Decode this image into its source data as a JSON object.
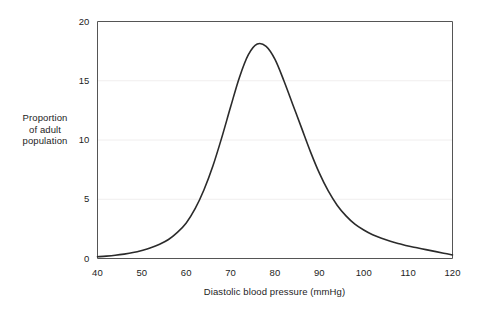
{
  "chart_data": {
    "type": "line",
    "title": "",
    "xlabel": "Diastolic blood pressure (mmHg)",
    "ylabel": "Proportion of adult population",
    "ylabel_lines": [
      "Proportion",
      "of adult",
      "population"
    ],
    "xlim": [
      40,
      120
    ],
    "ylim": [
      0,
      20
    ],
    "xticks": [
      40,
      50,
      60,
      70,
      80,
      90,
      100,
      110,
      120
    ],
    "yticks": [
      0,
      5,
      10,
      15,
      20
    ],
    "grid": "horizontal-faint",
    "legend": "none",
    "line_color": "#2b2b2b",
    "series": [
      {
        "name": "Proportion of adult population",
        "x": [
          40,
          42,
          44,
          46,
          48,
          50,
          52,
          54,
          56,
          58,
          60,
          62,
          64,
          66,
          68,
          70,
          72,
          74,
          76,
          78,
          80,
          82,
          84,
          86,
          88,
          90,
          92,
          94,
          96,
          98,
          100,
          102,
          104,
          106,
          108,
          110,
          112,
          114,
          116,
          118,
          120
        ],
        "values": [
          0.15,
          0.2,
          0.27,
          0.37,
          0.5,
          0.68,
          0.9,
          1.2,
          1.6,
          2.2,
          3.0,
          4.2,
          5.8,
          7.8,
          10.2,
          12.8,
          15.3,
          17.2,
          18.1,
          17.9,
          16.8,
          15.0,
          13.0,
          11.0,
          9.0,
          7.2,
          5.7,
          4.5,
          3.6,
          2.9,
          2.4,
          2.0,
          1.7,
          1.45,
          1.25,
          1.05,
          0.9,
          0.75,
          0.6,
          0.45,
          0.3
        ]
      }
    ],
    "peak": {
      "x": 76,
      "y": 18.1
    }
  },
  "axes": {
    "x_tick_labels": [
      "40",
      "50",
      "60",
      "70",
      "80",
      "90",
      "100",
      "110",
      "120"
    ],
    "y_tick_labels": [
      "0",
      "5",
      "10",
      "15",
      "20"
    ]
  }
}
